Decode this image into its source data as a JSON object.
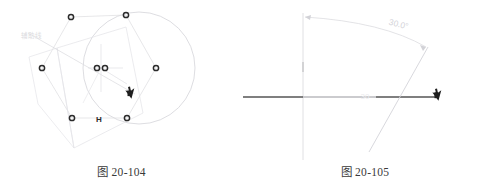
{
  "page": {
    "background_color": "#ffffff",
    "line_color_faint": "#d9d9dd",
    "line_color_dark": "#4a4a4a",
    "marker_color": "#2b2b2b",
    "text_color": "#3a3a3a",
    "label_color_faint": "#d6d6da"
  },
  "figures": [
    {
      "id": "figure-20-104",
      "caption": "图 20-104",
      "type": "cad-geometry-drawing",
      "annotation_label": "辅助线",
      "markers": [
        {
          "name": "node-top-left",
          "label": "",
          "x": 71,
          "y": 17
        },
        {
          "name": "node-top-right",
          "label": "",
          "x": 126,
          "y": 15
        },
        {
          "name": "node-left",
          "label": "",
          "x": 42,
          "y": 68
        },
        {
          "name": "node-center-a",
          "label": "",
          "x": 97,
          "y": 68
        },
        {
          "name": "node-center-b",
          "label": "",
          "x": 105,
          "y": 68
        },
        {
          "name": "node-right",
          "label": "",
          "x": 156,
          "y": 68
        },
        {
          "name": "node-bottom-left",
          "label": "",
          "x": 72,
          "y": 118
        },
        {
          "name": "node-bottom-mid",
          "label": "H",
          "x": 99,
          "y": 118
        },
        {
          "name": "node-bottom-right",
          "label": "",
          "x": 127,
          "y": 118
        }
      ],
      "cursor": {
        "name": "drawing-cursor",
        "x": 133,
        "y": 93
      },
      "circle": {
        "cx": 139,
        "cy": 68,
        "r": 56
      }
    },
    {
      "id": "figure-20-105",
      "caption": "图 20-105",
      "type": "cad-angle-dimension",
      "angle_label": "30.0°",
      "axis_label": "30",
      "cursor": {
        "name": "drawing-cursor",
        "x": 197,
        "y": 95
      },
      "vertex": {
        "x": 60,
        "y": 97
      },
      "horizontal_line": {
        "x1": -55,
        "y1": 97,
        "x2": 195,
        "y2": 97
      },
      "vertical_line": {
        "x1": 60,
        "y1": 13,
        "x2": 60,
        "y2": 160
      }
    }
  ]
}
